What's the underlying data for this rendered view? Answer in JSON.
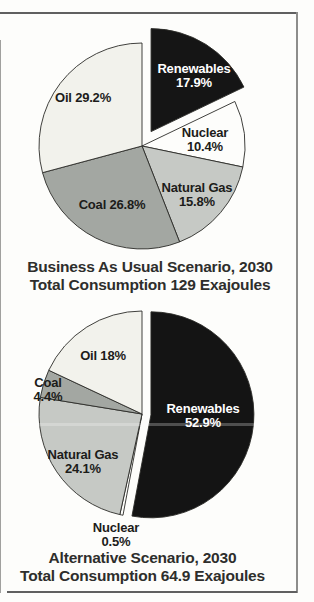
{
  "chart_data": [
    {
      "type": "pie",
      "title": "Business As Usual Scenario, 2030",
      "subtitle": "Total Consumption 129 Exajoules",
      "units": "%",
      "layout": {
        "cx": 142,
        "cy": 146,
        "r": 103,
        "start_deg": 0,
        "direction": "clockwise",
        "stroke": "#2b2b28",
        "stroke_width": 0.9
      },
      "slices": [
        {
          "label": "Renewables",
          "value": 17.9,
          "line1": "Renewables",
          "line2": "17.9%",
          "color": "#151515",
          "text_color": "#ffffff",
          "explode_px": 17
        },
        {
          "label": "Nuclear",
          "value": 10.4,
          "line1": "Nuclear",
          "line2": "10.4%",
          "color": "#fdfdfb",
          "explode_px": 0
        },
        {
          "label": "Natural Gas",
          "value": 15.8,
          "line1": "Natural Gas",
          "line2": "15.8%",
          "color": "#c6c9c5",
          "explode_px": 0
        },
        {
          "label": "Coal",
          "value": 26.8,
          "line1": "Coal 26.8%",
          "color": "#a3a7a2",
          "explode_px": 0
        },
        {
          "label": "Oil",
          "value": 29.2,
          "line1": "Oil 29.2%",
          "color": "#f2f2ec",
          "explode_px": 0
        }
      ]
    },
    {
      "type": "pie",
      "title": "Alternative Scenario, 2030",
      "subtitle": "Total Consumption 64.9 Exajoules",
      "units": "%",
      "layout": {
        "cx": 142,
        "cy": 414,
        "r": 103,
        "start_deg": 0,
        "direction": "clockwise",
        "stroke": "#2b2b28",
        "stroke_width": 0.9
      },
      "slices": [
        {
          "label": "Renewables",
          "value": 52.9,
          "line1": "Renewables",
          "line2": "52.9%",
          "color": "#141414",
          "text_color": "#ffffff",
          "explode_px": 9
        },
        {
          "label": "Nuclear",
          "value": 0.5,
          "line1": "Nuclear",
          "line2": "0.5%",
          "color": "#fdfdfb",
          "explode_px": 0
        },
        {
          "label": "Natural Gas",
          "value": 24.1,
          "line1": "Natural Gas",
          "line2": "24.1%",
          "color": "#c6c9c5",
          "explode_px": 0
        },
        {
          "label": "Coal",
          "value": 4.4,
          "line1": "Coal",
          "line2": "4.4%",
          "color": "#a3a7a2",
          "explode_px": 0
        },
        {
          "label": "Oil",
          "value": 18,
          "line1": "Oil 18%",
          "color": "#f2f2ec",
          "explode_px": 0
        }
      ]
    }
  ]
}
